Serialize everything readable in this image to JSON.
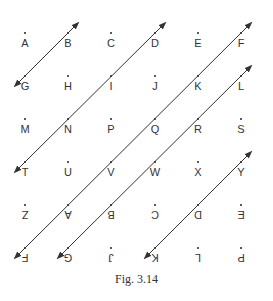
{
  "caption": "Fig. 3.14",
  "grid": {
    "cols_x": [
      25,
      68,
      111,
      155,
      198,
      241
    ],
    "rows_y": [
      32,
      75,
      118,
      161,
      204,
      247
    ],
    "rows": [
      [
        {
          "label": "A",
          "inv": false
        },
        {
          "label": "B",
          "inv": false
        },
        {
          "label": "C",
          "inv": false
        },
        {
          "label": "D",
          "inv": false
        },
        {
          "label": "E",
          "inv": false
        },
        {
          "label": "F",
          "inv": false
        }
      ],
      [
        {
          "label": "G",
          "inv": false
        },
        {
          "label": "H",
          "inv": false
        },
        {
          "label": "I",
          "inv": false
        },
        {
          "label": "J",
          "inv": false
        },
        {
          "label": "K",
          "inv": false
        },
        {
          "label": "L",
          "inv": false
        }
      ],
      [
        {
          "label": "M",
          "inv": false
        },
        {
          "label": "N",
          "inv": false
        },
        {
          "label": "P",
          "inv": false
        },
        {
          "label": "Q",
          "inv": false
        },
        {
          "label": "R",
          "inv": false
        },
        {
          "label": "S",
          "inv": false
        }
      ],
      [
        {
          "label": "T",
          "inv": false
        },
        {
          "label": "U",
          "inv": false
        },
        {
          "label": "V",
          "inv": false
        },
        {
          "label": "W",
          "inv": false
        },
        {
          "label": "X",
          "inv": false
        },
        {
          "label": "Y",
          "inv": false
        }
      ],
      [
        {
          "label": "Z",
          "inv": true
        },
        {
          "label": "A",
          "inv": true
        },
        {
          "label": "B",
          "inv": true
        },
        {
          "label": "C",
          "inv": true
        },
        {
          "label": "D",
          "inv": true
        },
        {
          "label": "E",
          "inv": true
        }
      ],
      [
        {
          "label": "F",
          "inv": true
        },
        {
          "label": "G",
          "inv": true
        },
        {
          "label": "J",
          "inv": true
        },
        {
          "label": "K",
          "inv": true
        },
        {
          "label": "L",
          "inv": true
        },
        {
          "label": "P",
          "inv": true
        }
      ]
    ]
  },
  "lines": [
    {
      "through": [
        "B",
        "G"
      ],
      "from": [
        1,
        0
      ],
      "to": [
        0,
        1
      ],
      "arrows": "both"
    },
    {
      "through": [
        "D",
        "I",
        "N",
        "T"
      ],
      "from": [
        3,
        0
      ],
      "to": [
        0,
        3
      ],
      "arrows": "both"
    },
    {
      "through": [
        "F",
        "K",
        "Q",
        "V",
        "A(inv)",
        "F(inv)"
      ],
      "from": [
        5,
        0
      ],
      "to": [
        0,
        5
      ],
      "arrows": "both"
    },
    {
      "through": [
        "L",
        "R",
        "W",
        "B(inv)",
        "G(inv)"
      ],
      "from": [
        5,
        1
      ],
      "to": [
        1,
        5
      ],
      "arrows": "both"
    },
    {
      "through": [
        "Y",
        "D(inv)",
        "K(inv)"
      ],
      "from": [
        5,
        3
      ],
      "to": [
        3,
        5
      ],
      "arrows": "both"
    }
  ],
  "colors": {
    "line": "#333333",
    "text": "#333333"
  }
}
